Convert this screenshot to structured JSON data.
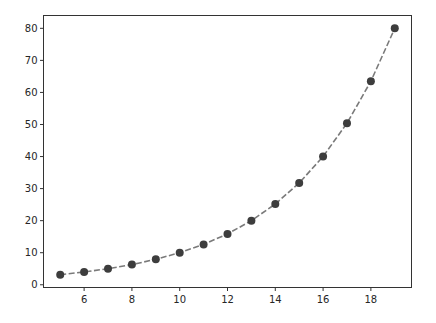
{
  "chart_data": {
    "type": "line",
    "title": "",
    "xlabel": "",
    "ylabel": "",
    "x": [
      5,
      6,
      7,
      8,
      9,
      10,
      11,
      12,
      13,
      14,
      15,
      16,
      17,
      18,
      19
    ],
    "series": [
      {
        "name": "",
        "values": [
          3.15,
          3.97,
          5.0,
          6.3,
          7.94,
          10.0,
          12.6,
          15.87,
          20.0,
          25.2,
          31.75,
          40.0,
          50.4,
          63.5,
          80.0
        ],
        "line_style": "dashed",
        "marker": "circle",
        "line_color": "#7a7a7a",
        "marker_color": "#3d3d3d"
      }
    ],
    "xlim": [
      4.3,
      19.7
    ],
    "ylim": [
      -0.85,
      84.0
    ],
    "xticks": [
      6,
      8,
      10,
      12,
      14,
      16,
      18
    ],
    "yticks": [
      0,
      10,
      20,
      30,
      40,
      50,
      60,
      70,
      80
    ],
    "grid": false,
    "legend": null
  }
}
